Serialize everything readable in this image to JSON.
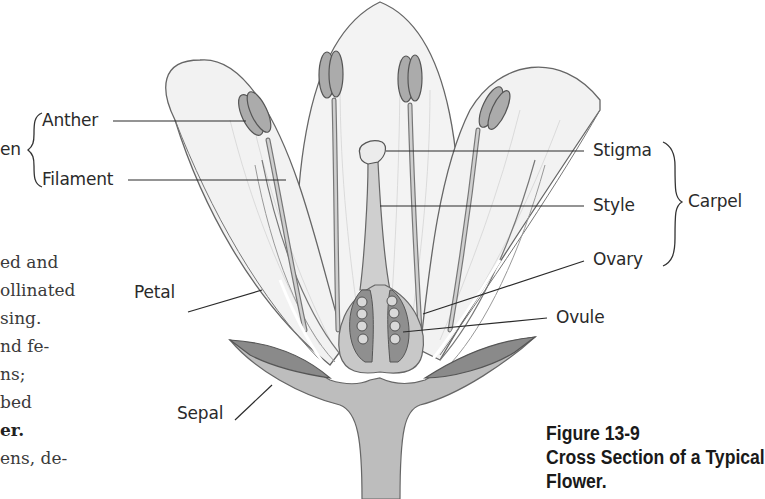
{
  "figure": {
    "number": "Figure 13-9",
    "title_line1": "Cross Section of a Typical",
    "title_line2": "Flower."
  },
  "labels": {
    "stamen_group": "en",
    "anther": "Anther",
    "filament": "Filament",
    "petal": "Petal",
    "sepal": "Sepal",
    "stigma": "Stigma",
    "style": "Style",
    "ovary": "Ovary",
    "ovule": "Ovule",
    "carpel_group": "Carpel"
  },
  "body_text_fragments": [
    "ed and",
    "ollinated",
    "sing.",
    "nd fe-",
    "ns;",
    "bed",
    "er.",
    "ens, de-"
  ],
  "colors": {
    "outline": "#555555",
    "petal_fill": "#f1f1f1",
    "anther_fill": "#a9a9a9",
    "sepal_fill": "#9a9a9a",
    "receptacle_fill": "#bdbdbd",
    "ovary_fill": "#c8c8c8",
    "ovule_fill": "#d8d8d8",
    "leader_line": "#2a2a2a"
  }
}
